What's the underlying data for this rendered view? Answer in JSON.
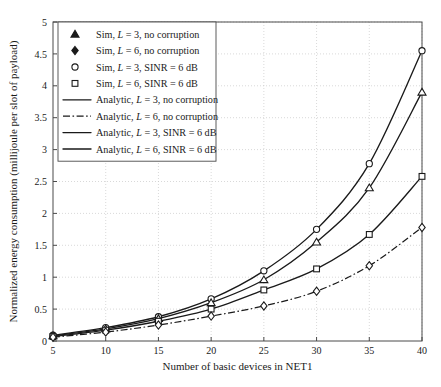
{
  "chart_data": {
    "type": "line",
    "title": "",
    "xlabel": "Number of basic devices in NET1",
    "ylabel": "Normalized energy consumption (millijoule per slot of payload)",
    "xlim": [
      5,
      40
    ],
    "ylim": [
      0,
      5
    ],
    "x": [
      5,
      10,
      15,
      20,
      25,
      30,
      35,
      40
    ],
    "xticks": [
      "5",
      "10",
      "15",
      "20",
      "25",
      "30",
      "35",
      "40"
    ],
    "yticks": [
      "0",
      "0.5",
      "1",
      "1.5",
      "2",
      "2.5",
      "3",
      "3.5",
      "4",
      "4.5",
      "5"
    ],
    "grid": true,
    "legend_position": "upper-left",
    "series": [
      {
        "name": "Sim, L = 3, SINR = 6 dB",
        "marker": "circle",
        "line": "solid",
        "values": [
          0.09,
          0.21,
          0.38,
          0.66,
          1.1,
          1.75,
          2.78,
          4.55
        ]
      },
      {
        "name": "Sim, L = 3, no corruption",
        "marker": "triangle",
        "line": "solid",
        "values": [
          0.08,
          0.19,
          0.35,
          0.6,
          0.96,
          1.55,
          2.4,
          3.9
        ]
      },
      {
        "name": "Sim, L = 6, SINR = 6 dB",
        "marker": "square",
        "line": "solid",
        "values": [
          0.07,
          0.17,
          0.31,
          0.5,
          0.8,
          1.13,
          1.67,
          2.58
        ]
      },
      {
        "name": "Sim, L = 6, no corruption",
        "marker": "diamond",
        "line": "dashdot",
        "values": [
          0.06,
          0.14,
          0.25,
          0.39,
          0.55,
          0.78,
          1.18,
          1.78
        ]
      }
    ]
  },
  "legend": {
    "entries": [
      {
        "key": "sim-l3-no-corruption",
        "symbol": "triangle-filled",
        "kind": "marker",
        "label_prefix": "Sim, ",
        "label_var": "L",
        "label_suffix": " = 3, no corruption"
      },
      {
        "key": "sim-l6-no-corruption",
        "symbol": "diamond-filled",
        "kind": "marker",
        "label_prefix": "Sim, ",
        "label_var": "L",
        "label_suffix": " = 6, no corruption"
      },
      {
        "key": "sim-l3-sinr6",
        "symbol": "circle-open",
        "kind": "marker",
        "label_prefix": "Sim, ",
        "label_var": "L",
        "label_suffix": " = 3, SINR = 6 dB"
      },
      {
        "key": "sim-l6-sinr6",
        "symbol": "square-open",
        "kind": "marker",
        "label_prefix": "Sim, ",
        "label_var": "L",
        "label_suffix": " = 6, SINR = 6 dB"
      },
      {
        "key": "analytic-l3-no-corruption",
        "symbol": "line-solid",
        "kind": "line",
        "label_prefix": "Analytic, ",
        "label_var": "L",
        "label_suffix": " = 3, no corruption"
      },
      {
        "key": "analytic-l6-no-corruption",
        "symbol": "line-dashdot",
        "kind": "line",
        "label_prefix": "Analytic, ",
        "label_var": "L",
        "label_suffix": " = 6, no corruption"
      },
      {
        "key": "analytic-l3-sinr6",
        "symbol": "line-solid",
        "kind": "line",
        "label_prefix": "Analytic, ",
        "label_var": "L",
        "label_suffix": " = 3, SINR = 6 dB"
      },
      {
        "key": "analytic-l6-sinr6",
        "symbol": "line-solid",
        "kind": "line",
        "label_prefix": "Analytic, ",
        "label_var": "L",
        "label_suffix": " = 6, SINR = 6 dB"
      }
    ]
  },
  "colors": {
    "axis": "#4a4a4a",
    "grid": "#c9c9c9",
    "curve": "#1a1a1a",
    "background": "#ffffff"
  }
}
